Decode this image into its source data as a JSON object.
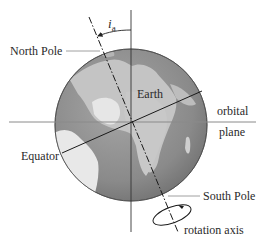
{
  "diagram": {
    "type": "earth-axial-tilt",
    "labels": {
      "north_pole": "North Pole",
      "south_pole": "South Pole",
      "earth": "Earth",
      "equator": "Equator",
      "orbital_line1": "orbital",
      "orbital_line2": "plane",
      "rotation_axis": "rotation axis",
      "tilt_symbol": "i",
      "tilt_subscript": "a"
    },
    "colors": {
      "ocean": "#8c8c8c",
      "land": "#c9c9c9",
      "land_bright": "#ececec",
      "line": "#222222",
      "leader": "#777777",
      "plane": "#9a9a9a"
    }
  }
}
